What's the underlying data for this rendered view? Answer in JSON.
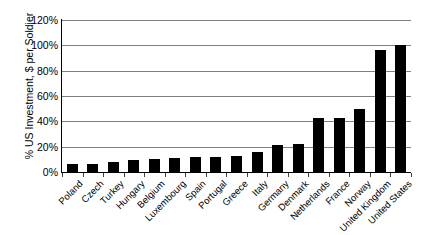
{
  "chart_data": {
    "type": "bar",
    "title": "",
    "xlabel": "",
    "ylabel": "% US Investment, $  per Soldier",
    "ylim": [
      0,
      120
    ],
    "ytick_labels": [
      "0%",
      "20%",
      "40%",
      "60%",
      "80%",
      "100%",
      "120%"
    ],
    "ytick_values": [
      0,
      20,
      40,
      60,
      80,
      100,
      120
    ],
    "grid": true,
    "legend": "none",
    "bar_color": "#000000",
    "grid_color": "#808080",
    "axis_color": "#000000",
    "categories": [
      "Poland",
      "Czech",
      "Turkey",
      "Hungary",
      "Belgium",
      "Luxembourg",
      "Spain",
      "Portugal",
      "Greece",
      "Italy",
      "Germany",
      "Denmark",
      "Netherlands",
      "France",
      "Norway",
      "United Kingdom",
      "United States"
    ],
    "values": [
      6,
      6.5,
      8,
      9.5,
      10,
      11,
      11.5,
      12,
      13,
      16,
      21,
      22,
      43,
      43,
      50,
      96,
      100
    ]
  }
}
